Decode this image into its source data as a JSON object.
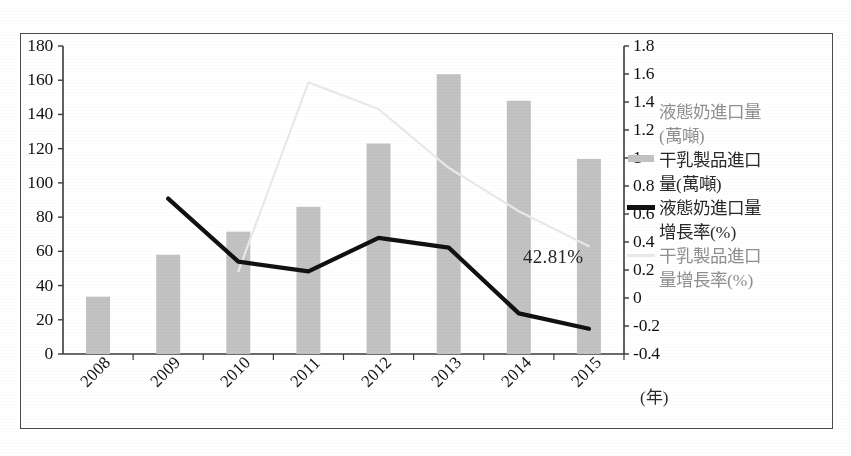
{
  "chart_data": {
    "type": "bar",
    "title": "",
    "subtitle": "",
    "xlabel": "(年)",
    "categories": [
      "2008",
      "2009",
      "2010",
      "2011",
      "2012",
      "2013",
      "2014",
      "2015"
    ],
    "grid": false,
    "legend_position": "right",
    "axes": {
      "left": {
        "label": "",
        "ylim": [
          0,
          180
        ],
        "ticks": [
          "0",
          "20",
          "40",
          "60",
          "80",
          "100",
          "120",
          "140",
          "160",
          "180"
        ],
        "tick_values": [
          0,
          20,
          40,
          60,
          80,
          100,
          120,
          140,
          160,
          180
        ]
      },
      "right": {
        "label": "",
        "ylim": [
          -0.4,
          1.8
        ],
        "ticks": [
          "-0.4",
          "-0.2",
          "0",
          "0.2",
          "0.4",
          "0.6",
          "0.8",
          "1",
          "1.2",
          "1.4",
          "1.6",
          "1.8"
        ],
        "tick_values": [
          -0.4,
          -0.2,
          0,
          0.2,
          0.4,
          0.6,
          0.8,
          1.0,
          1.2,
          1.4,
          1.6,
          1.8
        ]
      }
    },
    "series": [
      {
        "name": "液態奶進口量(萬噸)",
        "kind": "bar",
        "axis": "left",
        "color": "#c2c2c2",
        "marker": "none",
        "values": [
          null,
          null,
          null,
          null,
          null,
          null,
          null,
          null
        ]
      },
      {
        "name": "干乳製品進口量(萬噸)",
        "kind": "bar",
        "axis": "left",
        "color": "#c2c2c2",
        "marker": "bar",
        "values": [
          33.5,
          58.0,
          71.5,
          86.0,
          123.0,
          163.5,
          148.0,
          114.0
        ]
      },
      {
        "name": "液態奶進口量增長率(%)",
        "kind": "line",
        "axis": "right",
        "color": "#111111",
        "marker": "line-dark",
        "values": [
          null,
          0.71,
          0.26,
          0.19,
          0.43,
          0.36,
          -0.11,
          -0.22
        ]
      },
      {
        "name": "干乳製品進口量增長率(%)",
        "kind": "line",
        "axis": "right",
        "color": "#e9e9e9",
        "marker": "line-light",
        "values": [
          null,
          null,
          0.19,
          1.54,
          1.35,
          0.93,
          0.62,
          0.37
        ]
      }
    ],
    "annotations": [
      {
        "text": "42.81%",
        "x": "2014",
        "value": 0.4281
      }
    ]
  },
  "legend": {
    "items": [
      {
        "label": "液態奶進口量",
        "label2": "(萬噸)",
        "marker": "none",
        "tone": "muted"
      },
      {
        "label": "干乳製品進口",
        "label2": "量(萬噸)",
        "marker": "bar",
        "tone": "dark"
      },
      {
        "label": "液態奶進口量",
        "label2": "增長率(%)",
        "marker": "line-dark",
        "tone": "dark"
      },
      {
        "label": "干乳製品進口",
        "label2": "量增長率(%)",
        "marker": "line-light",
        "tone": "muted"
      }
    ]
  },
  "colors": {
    "bar": "#c2c2c2",
    "line_dark": "#111111",
    "line_light": "#e9e9e9",
    "axis": "#3a3a3a",
    "frame": "#4a4a4a",
    "text": "#1c1c1c"
  }
}
